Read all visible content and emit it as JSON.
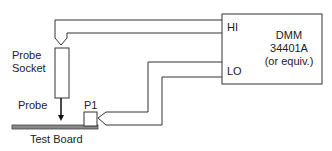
{
  "diagram": {
    "labels": {
      "probe_socket_line1": "Probe",
      "probe_socket_line2": "Socket",
      "probe": "Probe",
      "p1": "P1",
      "test_board": "Test Board",
      "hi": "HI",
      "lo": "LO",
      "dmm_line1": "DMM",
      "dmm_line2": "34401A",
      "dmm_line3": "(or equiv.)"
    },
    "colors": {
      "line": "#333333",
      "board_fill": "#888888"
    }
  }
}
